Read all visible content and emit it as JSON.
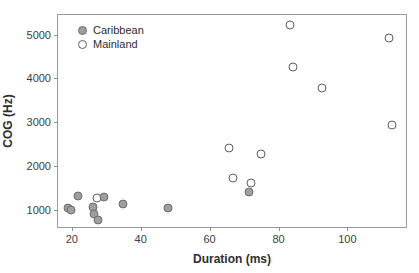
{
  "chart_data": {
    "type": "scatter",
    "title": "",
    "xlabel": "Duration (ms)",
    "ylabel": "COG (Hz)",
    "xlim": [
      16,
      117
    ],
    "ylim": [
      600,
      5450
    ],
    "xticks": [
      "20",
      "40",
      "60",
      "80",
      "100"
    ],
    "xtick_values": [
      20,
      40,
      60,
      80,
      100
    ],
    "yticks": [
      "1000",
      "2000",
      "3000",
      "4000",
      "5000"
    ],
    "ytick_values": [
      1000,
      2000,
      3000,
      4000,
      5000
    ],
    "grid": false,
    "legend_position": "top-left",
    "series": [
      {
        "name": "Caribbean",
        "marker": "filled-circle",
        "color": "#9e9e9e",
        "edge_color": "#6d6d6d",
        "points": [
          {
            "x": 19.0,
            "y": 1030
          },
          {
            "x": 19.8,
            "y": 1000
          },
          {
            "x": 21.8,
            "y": 1320
          },
          {
            "x": 26.3,
            "y": 1050
          },
          {
            "x": 26.5,
            "y": 890
          },
          {
            "x": 27.6,
            "y": 760
          },
          {
            "x": 29.3,
            "y": 1290
          },
          {
            "x": 35.0,
            "y": 1120
          },
          {
            "x": 47.8,
            "y": 1040
          },
          {
            "x": 71.4,
            "y": 1400
          }
        ]
      },
      {
        "name": "Mainland",
        "marker": "open-circle",
        "color": "#ffffff",
        "edge_color": "#5e5e5e",
        "points": [
          {
            "x": 27.3,
            "y": 1270
          },
          {
            "x": 65.6,
            "y": 2400
          },
          {
            "x": 66.9,
            "y": 1730
          },
          {
            "x": 71.9,
            "y": 1600
          },
          {
            "x": 75.0,
            "y": 2270
          },
          {
            "x": 83.2,
            "y": 5220
          },
          {
            "x": 84.3,
            "y": 4270
          },
          {
            "x": 92.6,
            "y": 3790
          },
          {
            "x": 112.2,
            "y": 4920
          },
          {
            "x": 113.0,
            "y": 2930
          }
        ]
      }
    ]
  },
  "legend": {
    "entries": [
      {
        "label": "Caribbean",
        "marker_name": "filled-circle-marker"
      },
      {
        "label": "Mainland",
        "marker_name": "open-circle-marker"
      }
    ]
  },
  "colors": {
    "caribbean_fill": "#9e9e9e",
    "caribbean_edge": "#6d6d6d",
    "mainland_fill": "#ffffff",
    "mainland_edge": "#5e5e5e",
    "frame": "#9a9a9a",
    "text": "#2e2e2e"
  }
}
